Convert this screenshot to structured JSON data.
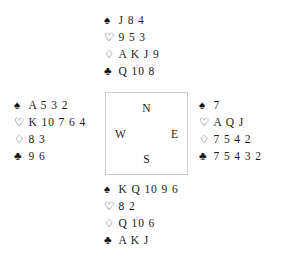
{
  "diagram": {
    "type": "bridge-hand-diagram",
    "background_color": "#ffffff",
    "text_color": "#1a1a1a",
    "box_border_color": "#cccccc",
    "suit_symbols": {
      "spade": "♠",
      "heart": "♡",
      "diamond": "♢",
      "club": "♣"
    },
    "compass": {
      "north": "N",
      "east": "E",
      "south": "S",
      "west": "W"
    },
    "hands": {
      "north": {
        "label": "North",
        "spades": "J 8 4",
        "hearts": "9 5 3",
        "diamonds": "A K J 9",
        "clubs": "Q 10 8"
      },
      "west": {
        "label": "West",
        "spades": "A 5 3 2",
        "hearts": "K 10 7 6 4",
        "diamonds": "8 3",
        "clubs": "9 6"
      },
      "east": {
        "label": "East",
        "spades": "7",
        "hearts": "A Q J",
        "diamonds": "7 5 4 2",
        "clubs": "7 5 4 3 2"
      },
      "south": {
        "label": "South",
        "spades": "K Q 10 9 6",
        "hearts": "8 2",
        "diamonds": "Q 10 6",
        "clubs": "A K J"
      }
    }
  }
}
